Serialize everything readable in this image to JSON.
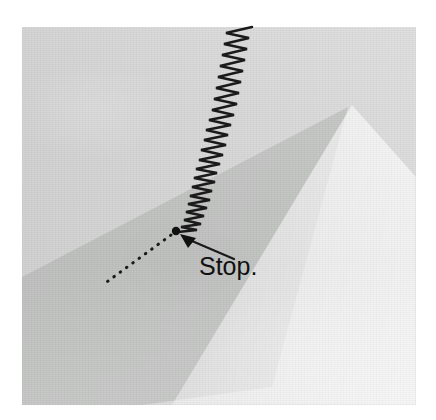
{
  "image": {
    "kind": "photograph-with-annotation",
    "canvas": {
      "width": 436,
      "height": 420,
      "background": "#ffffff"
    },
    "photo": {
      "left": 22,
      "top": 27,
      "width": 394,
      "height": 378,
      "subject": "light gray textured canvas / paper surface under raking light",
      "base_color": "#d6d7d6",
      "shadow_wedge_color": "#c6c8c6",
      "highlight_band_color": "#e6e7e6"
    }
  },
  "annotation": {
    "label": "Stop.",
    "label_color": "#111111",
    "label_position": {
      "x": 199,
      "y": 254
    },
    "ink_color": "#1a1a1a",
    "zigzag": {
      "description": "dense hand-drawn sawtooth / zigzag stroke running from the top edge of the photo down and to the left, ending at a point",
      "start": {
        "x": 237,
        "y": 27
      },
      "end": {
        "x": 177,
        "y": 231
      },
      "teeth": 46,
      "amplitude_start": 17,
      "amplitude_end": 9
    },
    "terminal_dot": {
      "x": 176,
      "y": 231,
      "radius": 4
    },
    "dotted_line": {
      "description": "dotted guide line running down-left from the terminal dot",
      "from": {
        "x": 173,
        "y": 234
      },
      "to": {
        "x": 104,
        "y": 284
      },
      "dot_count": 17
    },
    "arrow": {
      "description": "solid arrow pointing up-left toward the terminal dot",
      "tail": {
        "x": 233,
        "y": 258
      },
      "head": {
        "x": 181,
        "y": 235
      }
    }
  }
}
